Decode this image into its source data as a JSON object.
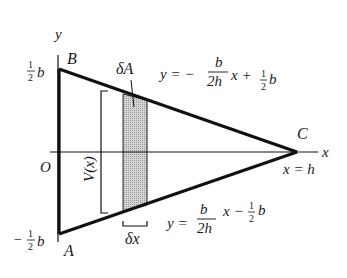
{
  "diagram": {
    "type": "triangle-area-element",
    "axes": {
      "x_label": "x",
      "y_label": "y",
      "origin_label": "O"
    },
    "vertices": {
      "A": {
        "label": "A",
        "coord": "(0, -1/2 b)"
      },
      "B": {
        "label": "B",
        "coord": "(0, 1/2 b)"
      },
      "C": {
        "label": "C",
        "coord": "(h, 0)"
      }
    },
    "tick_labels": {
      "top": {
        "sign": "",
        "num": "1",
        "den": "2",
        "var": "b"
      },
      "bottom": {
        "sign": "−",
        "num": "1",
        "den": "2",
        "var": "b"
      }
    },
    "lines": {
      "upper": {
        "prefix": "y = −",
        "frac_num": "b",
        "frac_den": "2h",
        "suffix": "x + ",
        "c_num": "1",
        "c_den": "2",
        "c_var": "b"
      },
      "lower": {
        "prefix": "y = ",
        "frac_num": "b",
        "frac_den": "2h",
        "suffix": "x − ",
        "c_num": "1",
        "c_den": "2",
        "c_var": "b"
      }
    },
    "annotations": {
      "strip_area": "δA",
      "strip_width": "δx",
      "height_function": "V(x)",
      "apex_condition": "x = h"
    },
    "colors": {
      "stroke": "#111111",
      "strip_fill": "#c8c8c8"
    }
  }
}
